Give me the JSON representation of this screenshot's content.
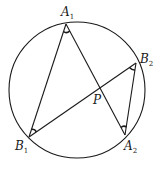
{
  "figure": {
    "circle": {
      "cx": 77,
      "cy": 90,
      "r": 68
    },
    "points": {
      "A1": {
        "x": 66,
        "y": 24,
        "label": "A",
        "sub": "1",
        "lx": 61,
        "ly": 16
      },
      "A2": {
        "x": 125,
        "y": 135,
        "label": "A",
        "sub": "2",
        "lx": 124,
        "ly": 150
      },
      "B1": {
        "x": 29,
        "y": 137,
        "label": "B",
        "sub": "1",
        "lx": 15,
        "ly": 150
      },
      "B2": {
        "x": 136,
        "y": 63,
        "label": "B",
        "sub": "2",
        "lx": 140,
        "ly": 63
      },
      "P": {
        "x": 99,
        "y": 88,
        "label": "P",
        "lx": 93,
        "ly": 104
      }
    },
    "segments": [
      [
        "A1",
        "B1"
      ],
      [
        "A1",
        "A2"
      ],
      [
        "B1",
        "B2"
      ],
      [
        "B2",
        "A2"
      ]
    ],
    "angle_marks": [
      "A1",
      "B1",
      "B2",
      "A2"
    ],
    "labels": {
      "A1": "A",
      "A1_sub": "1",
      "A2": "A",
      "A2_sub": "2",
      "B1": "B",
      "B1_sub": "1",
      "B2": "B",
      "B2_sub": "2",
      "P": "P"
    }
  }
}
